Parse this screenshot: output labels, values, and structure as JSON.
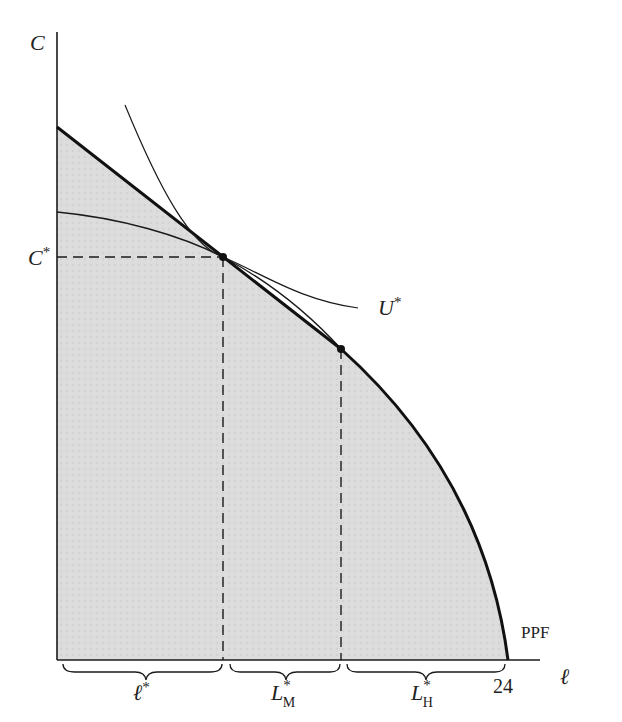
{
  "diagram": {
    "type": "economics-production-possibility-frontier",
    "axes": {
      "y_label": "C",
      "x_label": "ℓ",
      "x_max_label": "24"
    },
    "curves": {
      "ppf_label": "PPF",
      "indifference_label": "U",
      "indifference_superscript": "*"
    },
    "levels": {
      "c_star_label": "C",
      "c_star_superscript": "*"
    },
    "segments": [
      {
        "label": "ℓ",
        "superscript": "*",
        "subscript": ""
      },
      {
        "label": "L",
        "superscript": "*",
        "subscript": "M"
      },
      {
        "label": "L",
        "superscript": "*",
        "subscript": "H"
      }
    ],
    "colors": {
      "ink": "#1a1a1a",
      "shade": "#d6d6d6",
      "background": "#ffffff"
    }
  }
}
